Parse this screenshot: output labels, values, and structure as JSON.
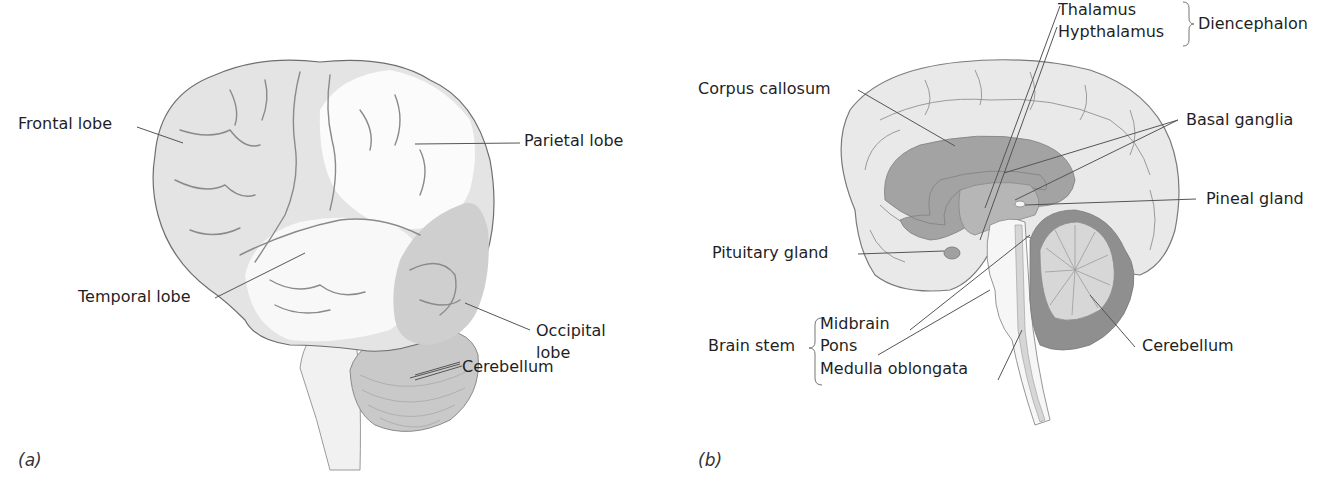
{
  "figure": {
    "panels": [
      {
        "id": "a",
        "letter": "(a)",
        "view": "lateral",
        "labels": {
          "frontal_lobe": "Frontal lobe",
          "parietal_lobe": "Parietal lobe",
          "temporal_lobe": "Temporal lobe",
          "occipital_lobe_1": "Occipital",
          "occipital_lobe_2": "lobe",
          "cerebellum": "Cerebellum"
        }
      },
      {
        "id": "b",
        "letter": "(b)",
        "view": "midsagittal",
        "labels": {
          "thalamus": "Thalamus",
          "hypthalamus": "Hypthalamus",
          "diencephalon": "Diencephalon",
          "corpus_callosum": "Corpus callosum",
          "basal_ganglia": "Basal ganglia",
          "pineal_gland": "Pineal gland",
          "pituitary_gland": "Pituitary gland",
          "brain_stem": "Brain stem",
          "midbrain": "Midbrain",
          "pons": "Pons",
          "medulla_oblongata": "Medulla oblongata",
          "cerebellum": "Cerebellum"
        }
      }
    ],
    "colors": {
      "frontal": "#e6e6e6",
      "parietal": "#fbfbfb",
      "temporal": "#f7f7f7",
      "occipital": "#cfcfcf",
      "cerebellum": "#c4c4c4",
      "cortex_medial": "#e9e9e9",
      "corpus_callosum": "#9a9a9a",
      "cerebellum_dark": "#8e8e8e",
      "stem": "#dcdcdc",
      "outline": "#777777"
    }
  }
}
